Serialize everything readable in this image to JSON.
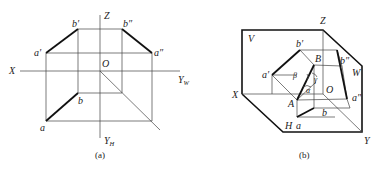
{
  "figure_a": {
    "caption": "(a)",
    "labels": {
      "Z": "Z",
      "X": "X",
      "O": "O",
      "YW": "Y",
      "YW_sub": "W",
      "YH": "Y",
      "YH_sub": "H",
      "a_prime": "a′",
      "b_prime": "b′",
      "a_dprime": "a″",
      "b_dprime": "b″",
      "a": "a",
      "b": "b"
    }
  },
  "figure_b": {
    "caption": "(b)",
    "labels": {
      "Z": "Z",
      "X": "X",
      "Y": "Y",
      "O": "O",
      "V": "V",
      "H": "H",
      "W": "W",
      "A": "A",
      "B": "B",
      "a_prime": "a′",
      "b_prime": "b′",
      "a_dprime": "a″",
      "b_dprime": "b″",
      "a": "a",
      "b": "b",
      "alpha": "α",
      "beta": "β",
      "gamma": "γ"
    }
  }
}
